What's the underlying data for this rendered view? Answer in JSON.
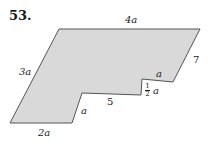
{
  "problem_number": "53.",
  "figure": {
    "fill_color": "#d9d9d9",
    "stroke_color": "#555555",
    "labels": {
      "top": "4a",
      "right": "7",
      "inner_step_top": "a",
      "step_height_num": "1",
      "step_height_den": "2",
      "step_height_var": "a",
      "inner_bottom": "5",
      "inner_slant": "a",
      "bottom": "2a",
      "left": "3a"
    }
  }
}
